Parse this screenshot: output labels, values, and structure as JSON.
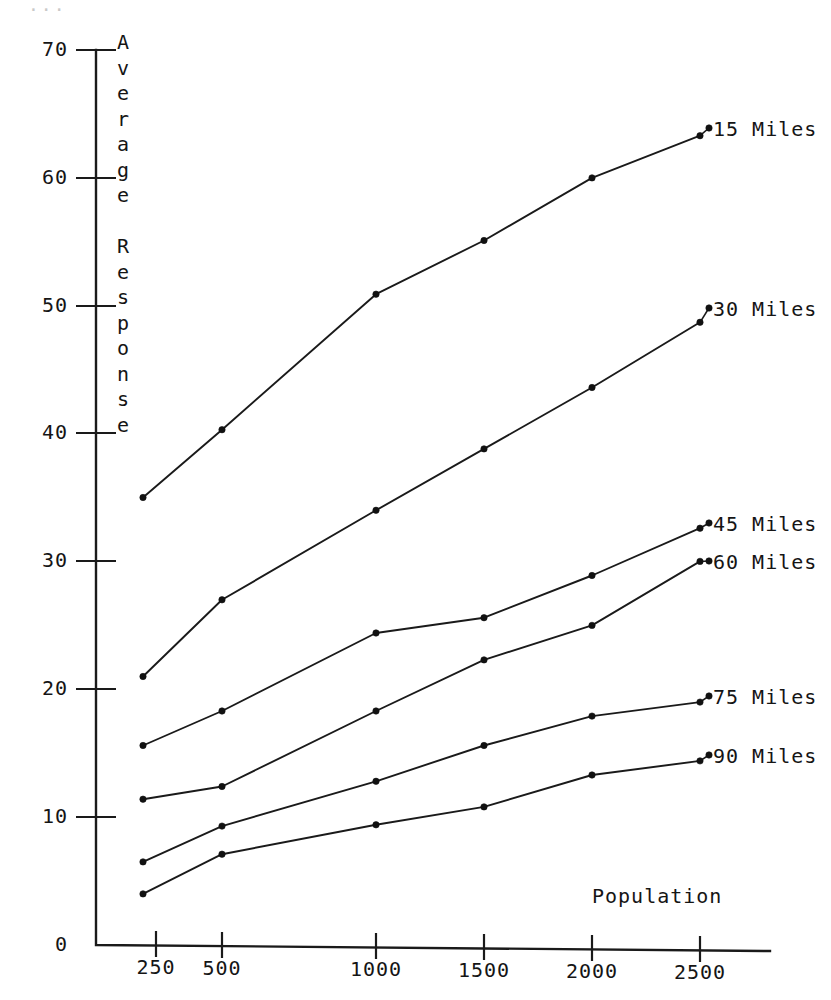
{
  "figure": {
    "background_color": "#ffffff",
    "ink_color": "#1a1a1a",
    "top_edge_artifact": "..."
  },
  "axes": {
    "y_axis_title_chars": [
      "A",
      "v",
      "e",
      "r",
      "a",
      "g",
      "e",
      "",
      "R",
      "e",
      "s",
      "p",
      "o",
      "n",
      "s",
      "e"
    ],
    "y_axis_title": "Average Response",
    "x_axis_title": "Population",
    "y_tick_labels": [
      "70",
      "60",
      "50",
      "40",
      "30",
      "20",
      "10",
      "0"
    ],
    "y_tick_values": [
      70,
      60,
      50,
      40,
      30,
      20,
      10,
      0
    ],
    "x_tick_labels": [
      "250",
      "500",
      "1000",
      "1500",
      "2000",
      "2500"
    ],
    "x_tick_values": [
      250,
      500,
      1000,
      1500,
      2000,
      2500
    ]
  },
  "chart_data": {
    "type": "line",
    "title": "",
    "subtitle": "",
    "xlabel": "Population",
    "ylabel": "Average Response",
    "x": [
      250,
      500,
      1000,
      1500,
      2000,
      2500
    ],
    "xtick_labels": [
      "250",
      "500",
      "1000",
      "1500",
      "2000",
      "2500"
    ],
    "ytick_labels": [
      "0",
      "10",
      "20",
      "30",
      "40",
      "50",
      "60",
      "70"
    ],
    "ylim": [
      0,
      70
    ],
    "x_scale": "categorical-uneven",
    "grid": false,
    "legend": "right-inline-labels",
    "markers": "filled-dot",
    "series": [
      {
        "name": "15 Miles",
        "values": [
          35.0,
          40.3,
          50.9,
          55.1,
          60.0,
          63.3
        ]
      },
      {
        "name": "30 Miles",
        "values": [
          21.0,
          27.0,
          34.0,
          38.8,
          43.6,
          48.7
        ]
      },
      {
        "name": "45 Miles",
        "values": [
          15.6,
          18.3,
          24.4,
          25.6,
          28.9,
          32.6
        ]
      },
      {
        "name": "60 Miles",
        "values": [
          11.4,
          12.4,
          18.3,
          22.3,
          25.0,
          30.0
        ]
      },
      {
        "name": "75 Miles",
        "values": [
          6.5,
          9.3,
          12.8,
          15.6,
          17.9,
          19.0
        ]
      },
      {
        "name": "90 Miles",
        "values": [
          4.0,
          7.1,
          9.4,
          10.8,
          13.3,
          14.4
        ]
      }
    ]
  },
  "series_labels": [
    {
      "text": "15 Miles",
      "x": 713,
      "y": 117
    },
    {
      "text": "30 Miles",
      "x": 713,
      "y": 297
    },
    {
      "text": "45 Miles",
      "x": 713,
      "y": 512
    },
    {
      "text": "60 Miles",
      "x": 713,
      "y": 550
    },
    {
      "text": "75 Miles",
      "x": 713,
      "y": 685
    },
    {
      "text": "90 Miles",
      "x": 713,
      "y": 744
    }
  ]
}
